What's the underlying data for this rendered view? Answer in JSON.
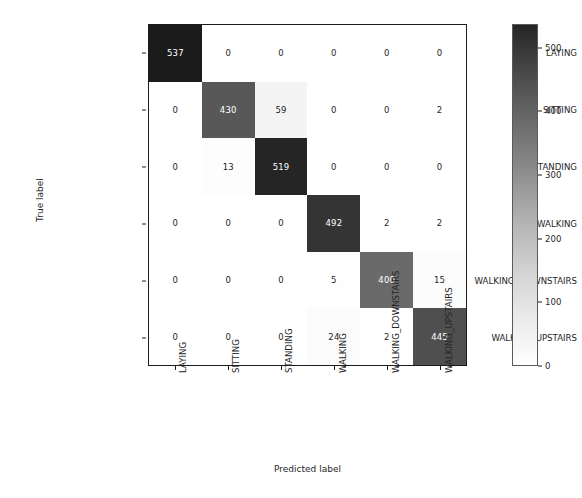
{
  "chart_data": {
    "type": "heatmap",
    "title": "",
    "xlabel": "Predicted label",
    "ylabel": "True label",
    "categories": [
      "LAYING",
      "SITTING",
      "STANDING",
      "WALKING",
      "WALKING_DOWNSTAIRS",
      "WALKING_UPSTAIRS"
    ],
    "x_tick_labels": [
      "LAYING",
      "SITTING",
      "STANDING",
      "WALKING",
      "WALKING_DOWNSTAIRS",
      "WALKING_UPSTAIRS"
    ],
    "y_tick_labels": [
      "LAYING",
      "SITTING",
      "STANDING",
      "WALKING",
      "WALKING_DOWNSTAIRS",
      "WALKING_UPSTAIRS"
    ],
    "x_tick_rotation": 90,
    "matrix": [
      [
        537,
        0,
        0,
        0,
        0,
        0
      ],
      [
        0,
        430,
        59,
        0,
        0,
        2
      ],
      [
        0,
        13,
        519,
        0,
        0,
        0
      ],
      [
        0,
        0,
        0,
        492,
        2,
        2
      ],
      [
        0,
        0,
        0,
        5,
        400,
        15
      ],
      [
        0,
        0,
        0,
        24,
        2,
        445
      ]
    ],
    "colormap": "Greys",
    "vmin": 0,
    "vmax": 537,
    "grid": false,
    "legend_position": "right",
    "colorbar": {
      "ticks": [
        0,
        100,
        200,
        300,
        400,
        500
      ],
      "tick_labels": [
        "0",
        "100",
        "200",
        "300",
        "400",
        "500"
      ],
      "min_color": "#ffffff",
      "max_color": "#242424"
    }
  }
}
